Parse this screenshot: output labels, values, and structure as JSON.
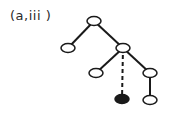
{
  "label": "(a,iii )",
  "tree": {
    "nodes": [
      {
        "id": "root",
        "x": 94,
        "y": 21,
        "filled": false
      },
      {
        "id": "left",
        "x": 68,
        "y": 48,
        "filled": false
      },
      {
        "id": "mid",
        "x": 123,
        "y": 48,
        "filled": false
      },
      {
        "id": "mid-left",
        "x": 96,
        "y": 73,
        "filled": false
      },
      {
        "id": "mid-right",
        "x": 150,
        "y": 73,
        "filled": false
      },
      {
        "id": "dashed-child",
        "x": 122,
        "y": 99,
        "filled": true
      },
      {
        "id": "bottom-right",
        "x": 150,
        "y": 100,
        "filled": false
      }
    ],
    "edges": [
      {
        "from": "root",
        "to": "left",
        "style": "solid"
      },
      {
        "from": "root",
        "to": "mid",
        "style": "solid"
      },
      {
        "from": "mid",
        "to": "mid-left",
        "style": "solid"
      },
      {
        "from": "mid",
        "to": "mid-right",
        "style": "solid"
      },
      {
        "from": "mid",
        "to": "dashed-child",
        "style": "dashed"
      },
      {
        "from": "mid-right",
        "to": "bottom-right",
        "style": "solid"
      }
    ],
    "colors": {
      "stroke": "#1a1a1a",
      "fill_empty": "#ffffff",
      "fill_solid": "#1a1a1a"
    }
  }
}
